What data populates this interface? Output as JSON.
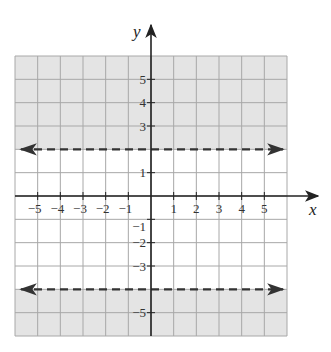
{
  "chart_data": {
    "type": "line",
    "title": "",
    "xlabel": "x",
    "ylabel": "y",
    "xlim": [
      -6,
      6
    ],
    "ylim": [
      -6,
      6
    ],
    "grid": true,
    "x_ticks": [
      -5,
      -4,
      -3,
      -2,
      -1,
      1,
      2,
      3,
      4,
      5
    ],
    "y_ticks": [
      -5,
      -3,
      -2,
      -1,
      1,
      3,
      4,
      5
    ],
    "x_tick_labels": [
      "−5",
      "−4",
      "−3",
      "−2",
      "−1",
      "1",
      "2",
      "3",
      "4",
      "5"
    ],
    "y_tick_labels": [
      {
        "value": 5,
        "label": "5"
      },
      {
        "value": 4,
        "label": "4"
      },
      {
        "value": 3,
        "label": "3"
      },
      {
        "value": 1,
        "label": "1"
      },
      {
        "value": -1,
        "label": "−1"
      },
      {
        "value": -2,
        "label": "−2"
      },
      {
        "value": -3,
        "label": "−3"
      },
      {
        "value": -5,
        "label": "−5"
      }
    ],
    "series": [
      {
        "name": "boundary y = 2",
        "equation": "y = 2",
        "style": "dashed",
        "arrows": "both",
        "y": 2
      },
      {
        "name": "boundary y = -4",
        "equation": "y = -4",
        "style": "dashed",
        "arrows": "both",
        "y": -4
      }
    ],
    "shaded_regions": [
      {
        "description": "y > 2",
        "from": 2,
        "to": 6
      },
      {
        "description": "y < -4",
        "from": -6,
        "to": -4
      }
    ]
  },
  "colors": {
    "shade": "#e4e4e4",
    "grid": "#a8a8a8",
    "axis": "#222222",
    "boundary": "#333333"
  }
}
